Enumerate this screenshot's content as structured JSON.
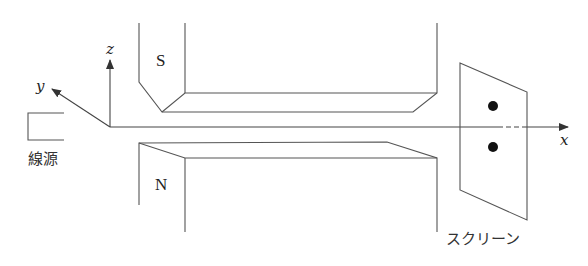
{
  "diagram": {
    "title": "",
    "axes": {
      "x_label": "x",
      "y_label": "y",
      "z_label": "z"
    },
    "source": {
      "label": "線源"
    },
    "magnets": {
      "top": {
        "pole": "S"
      },
      "bottom": {
        "pole": "N"
      }
    },
    "screen": {
      "label": "スクリーン",
      "spots": 2
    },
    "colors": {
      "line": "#555555",
      "spot": "#111111",
      "background": "#ffffff"
    }
  }
}
